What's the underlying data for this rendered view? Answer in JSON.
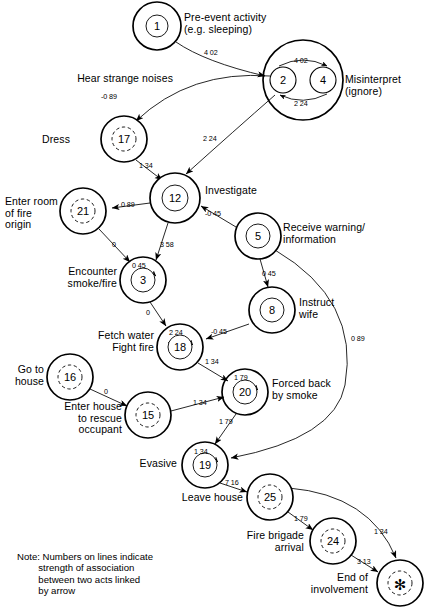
{
  "diagram": {
    "type": "flow-network",
    "note": "Note: Numbers on lines indicate\n        strength of association\n        between two acts linked\n        by arrow",
    "nodes": [
      {
        "id": "n1",
        "num": "1",
        "cx": 157,
        "cy": 26,
        "r": 24,
        "inner": 11,
        "dashed": false,
        "label": "Pre-event activity\n(e.g. sleeping)",
        "lx": 184,
        "ly": 12,
        "align": "left"
      },
      {
        "id": "n2",
        "num": "2",
        "cx": 283,
        "cy": 80,
        "r": 13,
        "inner": 13,
        "dashed": false,
        "label": "Hear strange noises",
        "lx": 173,
        "ly": 73,
        "align": "right"
      },
      {
        "id": "n4",
        "num": "4",
        "cx": 323,
        "cy": 80,
        "r": 13,
        "inner": 13,
        "dashed": false,
        "label": "Misinterpret\n(ignore)",
        "lx": 345,
        "ly": 74,
        "align": "left"
      },
      {
        "id": "n17",
        "num": "17",
        "cx": 124,
        "cy": 139,
        "r": 23,
        "inner": 12,
        "dashed": true,
        "label": "Dress",
        "lx": 70,
        "ly": 134,
        "align": "right"
      },
      {
        "id": "n12",
        "num": "12",
        "cx": 175,
        "cy": 198,
        "r": 25,
        "inner": 13,
        "dashed": false,
        "label": "Investigate",
        "lx": 205,
        "ly": 185,
        "align": "left"
      },
      {
        "id": "n21",
        "num": "21",
        "cx": 83,
        "cy": 211,
        "r": 23,
        "inner": 12,
        "dashed": true,
        "label": "Enter room\nof fire\norigin",
        "lx": 5,
        "ly": 196,
        "align": "left"
      },
      {
        "id": "n5",
        "num": "5",
        "cx": 258,
        "cy": 236,
        "r": 23,
        "inner": 12,
        "dashed": false,
        "label": "Receive warning/\ninformation",
        "lx": 283,
        "ly": 222,
        "align": "left"
      },
      {
        "id": "n3",
        "num": "3",
        "cx": 143,
        "cy": 280,
        "r": 23,
        "inner": 12,
        "dashed": false,
        "label": "Encounter\nsmoke/fire",
        "lx": 57,
        "ly": 266,
        "align": "right"
      },
      {
        "id": "n8",
        "num": "8",
        "cx": 272,
        "cy": 310,
        "r": 23,
        "inner": 12,
        "dashed": false,
        "label": "Instruct\nwife",
        "lx": 299,
        "ly": 297,
        "align": "left"
      },
      {
        "id": "n18",
        "num": "18",
        "cx": 180,
        "cy": 347,
        "r": 23,
        "inner": 12,
        "dashed": false,
        "label": "Fetch water\nFight fire",
        "lx": 93,
        "ly": 330,
        "align": "right"
      },
      {
        "id": "n16",
        "num": "16",
        "cx": 70,
        "cy": 377,
        "r": 23,
        "inner": 12,
        "dashed": true,
        "label": "Go to\nhouse",
        "lx": 10,
        "ly": 364,
        "align": "right"
      },
      {
        "id": "n20",
        "num": "20",
        "cx": 245,
        "cy": 392,
        "r": 23,
        "inner": 12,
        "dashed": false,
        "label": "Forced back\nby smoke",
        "lx": 272,
        "ly": 378,
        "align": "left"
      },
      {
        "id": "n15",
        "num": "15",
        "cx": 148,
        "cy": 415,
        "r": 23,
        "inner": 12,
        "dashed": true,
        "label": "Enter house\nto rescue\noccupant",
        "lx": 58,
        "ly": 401,
        "align": "right"
      },
      {
        "id": "n19",
        "num": "19",
        "cx": 205,
        "cy": 465,
        "r": 23,
        "inner": 12,
        "dashed": false,
        "label": "Evasive",
        "lx": 153,
        "ly": 458,
        "align": "right"
      },
      {
        "id": "n25",
        "num": "25",
        "cx": 270,
        "cy": 497,
        "r": 23,
        "inner": 12,
        "dashed": true,
        "label": "Leave house",
        "lx": 192,
        "ly": 492,
        "align": "right"
      },
      {
        "id": "n24",
        "num": "24",
        "cx": 333,
        "cy": 541,
        "r": 23,
        "inner": 12,
        "dashed": true,
        "label": "Fire brigade\narrival",
        "lx": 242,
        "ly": 530,
        "align": "right"
      },
      {
        "id": "nast",
        "num": "✻",
        "cx": 400,
        "cy": 583,
        "r": 23,
        "inner": 12,
        "dashed": true,
        "label": "End of\ninvolvement",
        "lx": 247,
        "ly": 572,
        "align": "right"
      }
    ],
    "edges": [
      {
        "from": "n1",
        "to": "n2",
        "weight": "4 02",
        "wx": 204,
        "wy": 48
      },
      {
        "from": "n2",
        "to": "n4",
        "weight": "4 02",
        "wx": 294,
        "wy": 56
      },
      {
        "from": "n4",
        "to": "n2",
        "weight": "2 24",
        "wx": 294,
        "wy": 99
      },
      {
        "from": "n2",
        "to": "n17",
        "weight": "-0 89",
        "wx": 110,
        "wy": 92
      },
      {
        "from": "n2",
        "to": "n12",
        "weight": "2 24",
        "wx": 203,
        "wy": 134
      },
      {
        "from": "n17",
        "to": "n12",
        "weight": "1 34",
        "wx": 139,
        "wy": 166
      },
      {
        "from": "n12",
        "to": "n21",
        "weight": "0 89",
        "wx": 121,
        "wy": 204
      },
      {
        "from": "n12",
        "to": "n3",
        "weight": "3 58",
        "wx": 160,
        "wy": 245
      },
      {
        "from": "n5",
        "to": "n12",
        "weight": "-0 45",
        "wx": 214,
        "wy": 213
      },
      {
        "from": "n21",
        "to": "n3",
        "weight": "0",
        "wx": 113,
        "wy": 244
      },
      {
        "from": "n3",
        "to": "n3",
        "weight": "0 45",
        "wx": 134,
        "wy": 266,
        "self": true
      },
      {
        "from": "n5",
        "to": "n8",
        "weight": "0 45",
        "wx": 262,
        "wy": 274
      },
      {
        "from": "n8",
        "to": "n18",
        "weight": "-0 45",
        "wx": 219,
        "wy": 334
      },
      {
        "from": "n3",
        "to": "n18",
        "weight": "0",
        "wx": 146,
        "wy": 313
      },
      {
        "from": "n18",
        "to": "n18",
        "weight": "2 24",
        "wx": 170,
        "wy": 334,
        "self": true
      },
      {
        "from": "n18",
        "to": "n20",
        "weight": "1 34",
        "wx": 208,
        "wy": 364
      },
      {
        "from": "n16",
        "to": "n15",
        "weight": "0",
        "wx": 106,
        "wy": 391
      },
      {
        "from": "n15",
        "to": "n20",
        "weight": "1 34",
        "wx": 196,
        "wy": 402
      },
      {
        "from": "n20",
        "to": "n20",
        "weight": "1 79",
        "wx": 235,
        "wy": 379,
        "self": true
      },
      {
        "from": "n20",
        "to": "n19",
        "weight": "1 79",
        "wx": 222,
        "wy": 421
      },
      {
        "from": "n19",
        "to": "n19",
        "weight": "1 34",
        "wx": 196,
        "wy": 452,
        "self": true
      },
      {
        "from": "n5",
        "to": "n19",
        "weight": "0 89",
        "wx": 353,
        "wy": 337
      },
      {
        "from": "n19",
        "to": "n25",
        "weight": "7 16",
        "wx": 229,
        "wy": 483
      },
      {
        "from": "n25",
        "to": "n24",
        "weight": "1 79",
        "wx": 297,
        "wy": 519
      },
      {
        "from": "n24",
        "to": "nast",
        "weight": "3 13",
        "wx": 360,
        "wy": 562
      },
      {
        "from": "n25",
        "to": "nast",
        "weight": "1 34",
        "wx": 377,
        "wy": 530
      }
    ]
  }
}
